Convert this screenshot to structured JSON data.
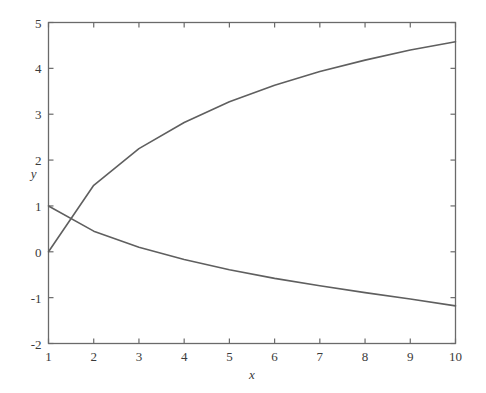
{
  "chart_data": {
    "type": "line",
    "title": "",
    "xlabel": "x",
    "ylabel": "y",
    "xlim": [
      1,
      10
    ],
    "ylim": [
      -2,
      5
    ],
    "xticks": [
      1,
      2,
      3,
      4,
      5,
      6,
      7,
      8,
      9,
      10
    ],
    "xtick_labels": [
      "1",
      "2",
      "3",
      "4",
      "5",
      "6",
      "7",
      "8",
      "9",
      "10"
    ],
    "yticks": [
      -2,
      -1,
      0,
      1,
      2,
      3,
      4,
      5
    ],
    "ytick_labels": [
      "-2",
      "-1",
      "0",
      "1",
      "2",
      "3",
      "4",
      "5"
    ],
    "grid": false,
    "legend": "none",
    "frame": "box-all-sides-with-inward-ticks",
    "line_color": "#5f5f5f",
    "line_width": 1.6,
    "axis_color": "#6a6a6a",
    "background": "#ffffff",
    "series": [
      {
        "name": "rising-curve",
        "x": [
          1,
          2,
          3,
          4,
          5,
          6,
          7,
          8,
          9,
          10
        ],
        "values": [
          0.0,
          1.45,
          2.25,
          2.82,
          3.27,
          3.63,
          3.93,
          4.18,
          4.4,
          4.58
        ]
      },
      {
        "name": "falling-curve",
        "x": [
          1,
          2,
          3,
          4,
          5,
          6,
          7,
          8,
          9,
          10
        ],
        "values": [
          1.0,
          0.45,
          0.1,
          -0.17,
          -0.39,
          -0.58,
          -0.74,
          -0.89,
          -1.03,
          -1.18
        ]
      }
    ]
  }
}
